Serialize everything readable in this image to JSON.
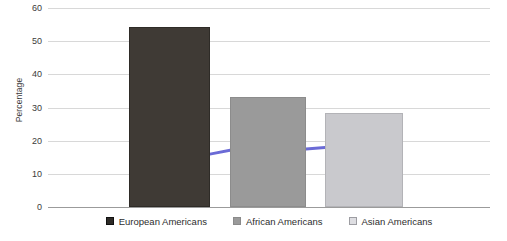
{
  "chart_data": {
    "type": "bar",
    "title": "",
    "xlabel": "",
    "ylabel": "Percentage",
    "ylim": [
      0,
      60
    ],
    "yticks": [
      0,
      10,
      20,
      30,
      40,
      50,
      60
    ],
    "ytick_labels": [
      "0",
      "10",
      "20",
      "30",
      "40",
      "50",
      "60"
    ],
    "grid": true,
    "legend_position": "bottom",
    "categories": [
      "European Americans",
      "African Americans",
      "Asian Americans"
    ],
    "values": [
      54.2,
      33.2,
      28.2
    ],
    "bar_colors": [
      "#3f3a35",
      "#9a9a9a",
      "#c9c9cd"
    ],
    "series": [
      {
        "name": "Percentage",
        "type": "bar",
        "values": [
          54.2,
          33.2,
          28.2
        ]
      },
      {
        "name": "overlay-line",
        "type": "line",
        "color": "#6b6bd6",
        "values": [
          15.6,
          17.1,
          17.9
        ]
      }
    ],
    "annotations": []
  },
  "legend": {
    "items": [
      {
        "label": "European Americans",
        "color": "#2e2b27",
        "swatch": "filled-dark-square"
      },
      {
        "label": "African Americans",
        "color": "#9a9a9a",
        "swatch": "filled-gray-square"
      },
      {
        "label": "Asian Americans",
        "color": "#dedee2",
        "swatch": "outlined-light-square"
      }
    ]
  },
  "axes": {
    "y_title": "Percentage"
  }
}
